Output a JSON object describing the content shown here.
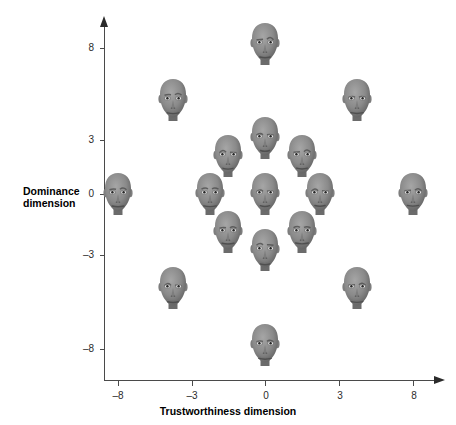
{
  "figure": {
    "background_color": "#ffffff",
    "axis_color": "#4a4a4a",
    "text_color": "#000000"
  },
  "axes": {
    "x": {
      "title": "Trustworthiness dimension",
      "ticks": [
        "–8",
        "–3",
        "0",
        "3",
        "8"
      ],
      "tick_values": [
        -8,
        -3,
        0,
        3,
        8
      ],
      "range": [
        -9.5,
        9.5
      ]
    },
    "y": {
      "title_line1": "Dominance",
      "title_line2": "dimension",
      "ticks": [
        "8",
        "3",
        "0",
        "–3",
        "–8"
      ],
      "tick_values": [
        8,
        3,
        0,
        -3,
        -8
      ],
      "range": [
        -9.5,
        9.5
      ]
    }
  },
  "chart_data": {
    "type": "scatter",
    "title": "",
    "xlabel": "Trustworthiness dimension",
    "ylabel": "Dominance dimension",
    "xlim": [
      -9.5,
      9.5
    ],
    "ylim": [
      -9.5,
      9.5
    ],
    "xticks": [
      -8,
      -3,
      0,
      3,
      8
    ],
    "yticks": [
      -8,
      -3,
      0,
      3,
      8
    ],
    "xticklabels": [
      "–8",
      "–3",
      "0",
      "3",
      "8"
    ],
    "yticklabels": [
      "8",
      "3",
      "0",
      "–3",
      "–8"
    ],
    "grid": false,
    "legend": "none",
    "marker": "face-image",
    "series": [
      {
        "name": "Computer-generated faces",
        "points": [
          {
            "x": 0,
            "y": 8,
            "label": "face-x0-y8"
          },
          {
            "x": -5,
            "y": 5,
            "label": "face-xn5-y5"
          },
          {
            "x": 5,
            "y": 5,
            "label": "face-x5-y5"
          },
          {
            "x": 0,
            "y": 3,
            "label": "face-x0-y3"
          },
          {
            "x": -2,
            "y": 2,
            "label": "face-xn2-y2"
          },
          {
            "x": 2,
            "y": 2,
            "label": "face-x2-y2"
          },
          {
            "x": -8,
            "y": 0,
            "label": "face-xn8-y0"
          },
          {
            "x": -3,
            "y": 0,
            "label": "face-xn3-y0"
          },
          {
            "x": 0,
            "y": 0,
            "label": "face-x0-y0"
          },
          {
            "x": 3,
            "y": 0,
            "label": "face-x3-y0"
          },
          {
            "x": 8,
            "y": 0,
            "label": "face-x8-y0"
          },
          {
            "x": -2,
            "y": -2,
            "label": "face-xn2-yn2"
          },
          {
            "x": 2,
            "y": -2,
            "label": "face-x2-yn2"
          },
          {
            "x": 0,
            "y": -3,
            "label": "face-x0-yn3"
          },
          {
            "x": -5,
            "y": -5,
            "label": "face-xn5-yn5"
          },
          {
            "x": 5,
            "y": -5,
            "label": "face-x5-yn5"
          },
          {
            "x": 0,
            "y": -8,
            "label": "face-x0-yn8"
          }
        ]
      }
    ],
    "n_points": 17
  }
}
